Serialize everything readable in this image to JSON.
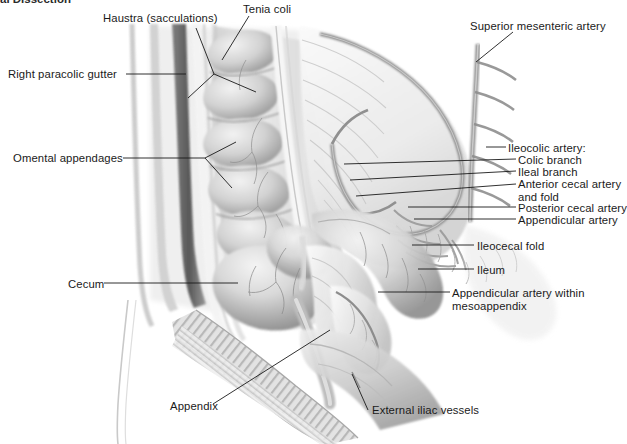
{
  "figure": {
    "title_fragment": "al Dissection",
    "type": "anatomical-illustration",
    "style": "grayscale pen-and-wash medical illustration",
    "background_color": "#ffffff",
    "ink_color": "#1a1a1a"
  },
  "labels": [
    {
      "id": "haustra",
      "text": "Haustra (sacculations)",
      "side": "top",
      "x": 103,
      "y": 12
    },
    {
      "id": "tenia-coli",
      "text": "Tenia coli",
      "side": "top",
      "x": 243,
      "y": 3
    },
    {
      "id": "superior-mesenteric",
      "text": "Superior mesenteric artery",
      "side": "top",
      "x": 470,
      "y": 20
    },
    {
      "id": "right-paracolic",
      "text": "Right paracolic gutter",
      "side": "left",
      "x": 8,
      "y": 68
    },
    {
      "id": "omental-appendages",
      "text": "Omental appendages",
      "side": "left",
      "x": 13,
      "y": 152
    },
    {
      "id": "cecum",
      "text": "Cecum",
      "side": "left",
      "x": 68,
      "y": 278
    },
    {
      "id": "appendix",
      "text": "Appendix",
      "side": "bottom",
      "x": 170,
      "y": 400
    },
    {
      "id": "external-iliac",
      "text": "External iliac vessels",
      "side": "bottom",
      "x": 372,
      "y": 404
    },
    {
      "id": "ileocolic-artery",
      "text": "Ileocolic artery:",
      "side": "right",
      "x": 508,
      "y": 142
    },
    {
      "id": "colic-branch",
      "text": "Colic branch",
      "side": "right",
      "x": 518,
      "y": 154,
      "indent": true
    },
    {
      "id": "ileal-branch",
      "text": "Ileal branch",
      "side": "right",
      "x": 518,
      "y": 166,
      "indent": true
    },
    {
      "id": "anterior-cecal",
      "text": "Anterior cecal artery\nand fold",
      "side": "right",
      "x": 518,
      "y": 178,
      "indent": true
    },
    {
      "id": "posterior-cecal",
      "text": "Posterior cecal artery",
      "side": "right",
      "x": 518,
      "y": 202,
      "indent": true
    },
    {
      "id": "appendicular-artery",
      "text": "Appendicular artery",
      "side": "right",
      "x": 518,
      "y": 214,
      "indent": true
    },
    {
      "id": "ileocecal-fold",
      "text": "Ileocecal fold",
      "side": "right",
      "x": 477,
      "y": 240
    },
    {
      "id": "ileum",
      "text": "Ileum",
      "side": "right",
      "x": 477,
      "y": 264
    },
    {
      "id": "appendicular-meso",
      "text": "Appendicular artery within\nmesoappendix",
      "side": "right",
      "x": 452,
      "y": 287
    }
  ],
  "structures": [
    {
      "name": "ascending-colon",
      "description": "Ascending colon with haustral sacculations along left side"
    },
    {
      "name": "tenia-coli-band",
      "description": "Longitudinal muscle band running down the colon"
    },
    {
      "name": "mesentery",
      "description": "Fan-shaped mesentery with vascular arcades"
    },
    {
      "name": "superior-mesenteric-artery",
      "description": "Main arterial trunk at upper right"
    },
    {
      "name": "ileocolic-arcade",
      "description": "Ileocolic artery arcade and branches"
    },
    {
      "name": "cecum-sac",
      "description": "Rounded cecal sac in lower left-center"
    },
    {
      "name": "appendix-tube",
      "description": "Vermiform appendix descending from cecum"
    },
    {
      "name": "mesoappendix",
      "description": "Triangular fold carrying the appendicular artery"
    },
    {
      "name": "abdominal-wall",
      "description": "Striated abdominal wall band running diagonally lower-left"
    },
    {
      "name": "iliac-vessel-ridge",
      "description": "External iliac vessels ridge in lower right"
    }
  ]
}
